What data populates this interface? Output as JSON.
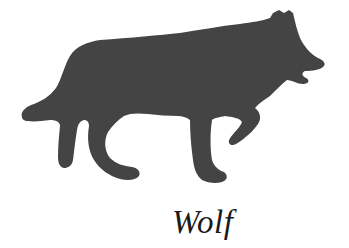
{
  "figure": {
    "caption": "Wolf",
    "colors": {
      "background": "#ffffff",
      "silhouette": "#444444",
      "caption": "#1a1a1a"
    }
  }
}
